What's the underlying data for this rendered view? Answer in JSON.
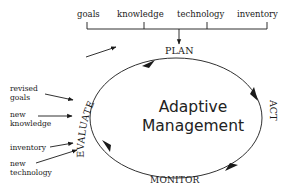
{
  "diagram": {
    "inputs_top": [
      "goals",
      "knowledge",
      "technology",
      "inventory"
    ],
    "stages": {
      "plan": "PLAN",
      "act": "ACT",
      "monitor": "MONITOR",
      "evaluate": "EVALUATE"
    },
    "center_title": {
      "line1": "Adaptive",
      "line2": "Management"
    },
    "evaluate_outputs": [
      "revised\ngoals",
      "new\nknowledge",
      "inventory",
      "new\ntechnology"
    ],
    "colors": {
      "stroke": "#1a1a1a",
      "background": "#ffffff"
    }
  }
}
